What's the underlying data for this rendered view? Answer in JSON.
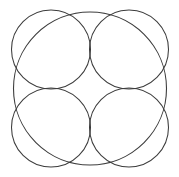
{
  "figure": {
    "title": "Geometric rosette of five overlapping circles",
    "caption": "",
    "background_color": "#ffffff",
    "stroke_color": "#3c3c3c",
    "stroke_width": 1.05,
    "canvas": {
      "width": 179,
      "height": 177
    }
  },
  "chart_data": {
    "type": "diagram",
    "title": "Geometric rosette of five overlapping circles",
    "xlabel": "",
    "ylabel": "",
    "grid": false,
    "legend": "none",
    "coordinate_system": "pixels, origin top-left",
    "xlim": [
      0,
      179
    ],
    "ylim": [
      0,
      177
    ],
    "center": {
      "x": 90,
      "y": 88.5
    },
    "shapes": [
      {
        "name": "outer-circle",
        "type": "circle",
        "cx": 90,
        "cy": 88.5,
        "r": 76.5,
        "stroke": "#3c3c3c",
        "fill": "none"
      },
      {
        "name": "inner-circle-top-left",
        "type": "circle",
        "cx": 51,
        "cy": 49.5,
        "r": 39.5,
        "stroke": "#3c3c3c",
        "fill": "none"
      },
      {
        "name": "inner-circle-top-right",
        "type": "circle",
        "cx": 129,
        "cy": 49.5,
        "r": 39.5,
        "stroke": "#3c3c3c",
        "fill": "none"
      },
      {
        "name": "inner-circle-bottom-left",
        "type": "circle",
        "cx": 51,
        "cy": 127.5,
        "r": 39.5,
        "stroke": "#3c3c3c",
        "fill": "none"
      },
      {
        "name": "inner-circle-bottom-right",
        "type": "circle",
        "cx": 129,
        "cy": 127.5,
        "r": 39.5,
        "stroke": "#3c3c3c",
        "fill": "none"
      }
    ],
    "nodes": [
      {
        "name": "center-node",
        "x": 90,
        "y": 88.5
      },
      {
        "name": "top-cusp",
        "x": 90,
        "y": 12
      },
      {
        "name": "bottom-cusp",
        "x": 90,
        "y": 165
      },
      {
        "name": "left-cusp",
        "x": 13.5,
        "y": 88.5
      },
      {
        "name": "right-cusp",
        "x": 166.5,
        "y": 88.5
      },
      {
        "name": "upper-left-node",
        "x": 51,
        "y": 49.5
      },
      {
        "name": "upper-right-node",
        "x": 129,
        "y": 49.5
      },
      {
        "name": "lower-left-node",
        "x": 51,
        "y": 127.5
      },
      {
        "name": "lower-right-node",
        "x": 129,
        "y": 127.5
      }
    ]
  }
}
